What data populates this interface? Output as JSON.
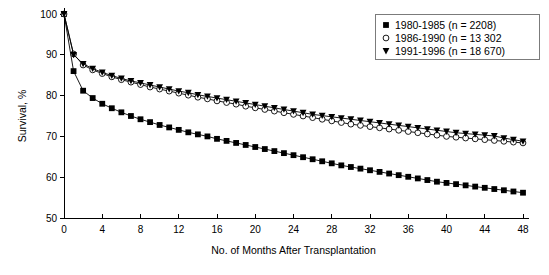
{
  "chart_data": {
    "type": "line",
    "title": "",
    "xlabel": "No. of Months After Transplantation",
    "ylabel": "Survival, %",
    "xlim": [
      0,
      48
    ],
    "ylim": [
      50,
      100
    ],
    "xticks": [
      0,
      4,
      8,
      12,
      16,
      20,
      24,
      28,
      32,
      36,
      40,
      44,
      48
    ],
    "yticks": [
      50,
      60,
      70,
      80,
      90,
      100
    ],
    "xticklabels": [
      "0",
      "4",
      "8",
      "12",
      "16",
      "20",
      "24",
      "28",
      "32",
      "36",
      "40",
      "44",
      "48"
    ],
    "yticklabels": [
      "50",
      "60",
      "70",
      "80",
      "90",
      "100"
    ],
    "grid": false,
    "legend_position": "top-right",
    "series": [
      {
        "name": "1980-1985 (n = 2208)",
        "marker": "filled-square",
        "x": [
          0,
          1,
          2,
          3,
          4,
          5,
          6,
          7,
          8,
          9,
          10,
          11,
          12,
          13,
          14,
          15,
          16,
          17,
          18,
          19,
          20,
          21,
          22,
          23,
          24,
          25,
          26,
          27,
          28,
          29,
          30,
          31,
          32,
          33,
          34,
          35,
          36,
          37,
          38,
          39,
          40,
          41,
          42,
          43,
          44,
          45,
          46,
          47,
          48
        ],
        "values": [
          100.0,
          86.0,
          81.2,
          79.4,
          78.0,
          76.9,
          75.9,
          75.0,
          74.2,
          73.5,
          72.8,
          72.2,
          71.6,
          71.0,
          70.5,
          70.0,
          69.4,
          68.9,
          68.4,
          67.9,
          67.4,
          66.9,
          66.4,
          65.9,
          65.4,
          64.9,
          64.4,
          63.9,
          63.4,
          62.9,
          62.5,
          62.1,
          61.7,
          61.3,
          60.9,
          60.5,
          60.1,
          59.7,
          59.3,
          58.9,
          58.6,
          58.3,
          58.0,
          57.7,
          57.4,
          57.1,
          56.8,
          56.5,
          56.2
        ]
      },
      {
        "name": "1986-1990 (n = 13 302",
        "marker": "open-circle",
        "x": [
          0,
          1,
          2,
          3,
          4,
          5,
          6,
          7,
          8,
          9,
          10,
          11,
          12,
          13,
          14,
          15,
          16,
          17,
          18,
          19,
          20,
          21,
          22,
          23,
          24,
          25,
          26,
          27,
          28,
          29,
          30,
          31,
          32,
          33,
          34,
          35,
          36,
          37,
          38,
          39,
          40,
          41,
          42,
          43,
          44,
          45,
          46,
          47,
          48
        ],
        "values": [
          100.0,
          90.2,
          87.5,
          86.3,
          85.4,
          84.6,
          83.9,
          83.3,
          82.7,
          82.1,
          81.6,
          81.1,
          80.6,
          80.1,
          79.6,
          79.2,
          78.7,
          78.3,
          77.9,
          77.4,
          77.0,
          76.6,
          76.2,
          75.8,
          75.4,
          75.0,
          74.6,
          74.2,
          73.8,
          73.4,
          73.0,
          72.7,
          72.4,
          72.1,
          71.8,
          71.5,
          71.2,
          70.9,
          70.6,
          70.3,
          70.0,
          69.8,
          69.6,
          69.4,
          69.2,
          69.0,
          68.8,
          68.6,
          68.4
        ]
      },
      {
        "name": "1991-1996 (n = 18 670)",
        "marker": "filled-triangle-down",
        "x": [
          0,
          1,
          2,
          3,
          4,
          5,
          6,
          7,
          8,
          9,
          10,
          11,
          12,
          13,
          14,
          15,
          16,
          17,
          18,
          19,
          20,
          21,
          22,
          23,
          24,
          25,
          26,
          27,
          28,
          29,
          30,
          31,
          32,
          33,
          34,
          35,
          36,
          37,
          38,
          39,
          40,
          41,
          42,
          43,
          44,
          45,
          46,
          47,
          48
        ],
        "values": [
          100.0,
          90.0,
          87.8,
          86.6,
          85.7,
          84.9,
          84.2,
          83.6,
          83.1,
          82.6,
          82.1,
          81.6,
          81.1,
          80.7,
          80.2,
          79.8,
          79.4,
          79.0,
          78.6,
          78.2,
          77.8,
          77.4,
          77.0,
          76.6,
          76.2,
          75.8,
          75.4,
          75.1,
          74.8,
          74.5,
          74.2,
          73.9,
          73.6,
          73.3,
          73.0,
          72.7,
          72.4,
          72.1,
          71.8,
          71.5,
          71.2,
          70.9,
          70.7,
          70.5,
          70.3,
          70.1,
          69.6,
          69.2,
          68.8
        ]
      }
    ]
  },
  "legend": {
    "entries": [
      {
        "marker": "filled-square",
        "label": "1980-1985 (n = 2208)"
      },
      {
        "marker": "open-circle",
        "label": "1986-1990 (n = 13 302"
      },
      {
        "marker": "filled-triangle-down",
        "label": "1991-1996 (n = 18 670)"
      }
    ]
  }
}
